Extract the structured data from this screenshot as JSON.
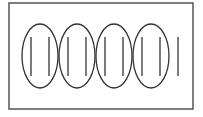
{
  "diagram": {
    "frame": {
      "x": 9,
      "y": 3,
      "width": 184,
      "height": 106,
      "stroke": "#555555"
    },
    "ellipse_stroke": "#333333",
    "line_stroke": "#333333",
    "ellipses": [
      {
        "cx": 40,
        "cy": 56,
        "rx": 18,
        "ry": 32
      },
      {
        "cx": 77,
        "cy": 56,
        "rx": 18,
        "ry": 32
      },
      {
        "cx": 114,
        "cy": 56,
        "rx": 18,
        "ry": 32
      },
      {
        "cx": 151,
        "cy": 56,
        "rx": 18,
        "ry": 32
      }
    ],
    "lines": [
      {
        "x": 31,
        "y1": 37,
        "y2": 76
      },
      {
        "x": 49,
        "y1": 37,
        "y2": 76
      },
      {
        "x": 68,
        "y1": 37,
        "y2": 76
      },
      {
        "x": 86,
        "y1": 37,
        "y2": 76
      },
      {
        "x": 105,
        "y1": 37,
        "y2": 76
      },
      {
        "x": 123,
        "y1": 37,
        "y2": 76
      },
      {
        "x": 142,
        "y1": 37,
        "y2": 76
      },
      {
        "x": 160,
        "y1": 37,
        "y2": 76
      },
      {
        "x": 178,
        "y1": 37,
        "y2": 76
      }
    ],
    "groups_count": 4,
    "items_per_group": 2,
    "remainder_count": 1
  }
}
